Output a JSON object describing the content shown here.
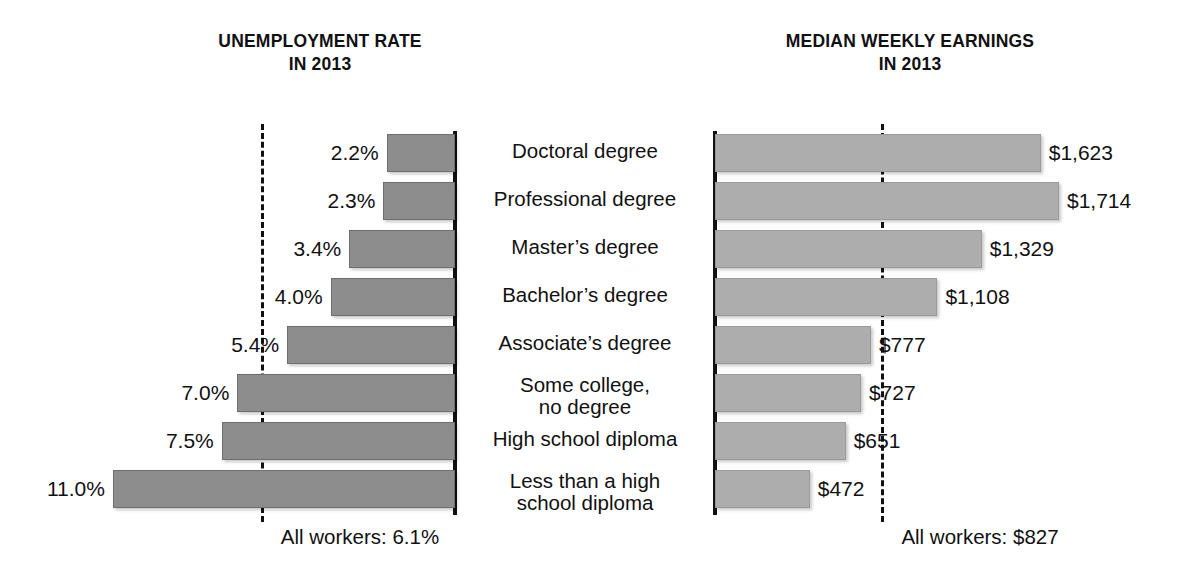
{
  "left_panel": {
    "title_line1": "UNEMPLOYMENT RATE",
    "title_line2": "IN 2013",
    "footer": "All workers: 6.1%"
  },
  "right_panel": {
    "title_line1": "MEDIAN WEEKLY EARNINGS",
    "title_line2": "IN 2013",
    "footer": "All workers: $827"
  },
  "categories": [
    {
      "line1": "Doctoral degree",
      "line2": ""
    },
    {
      "line1": "Professional degree",
      "line2": ""
    },
    {
      "line1": "Master’s degree",
      "line2": ""
    },
    {
      "line1": "Bachelor’s degree",
      "line2": ""
    },
    {
      "line1": "Associate’s degree",
      "line2": ""
    },
    {
      "line1": "Some college,",
      "line2": "no degree"
    },
    {
      "line1": "High school diploma",
      "line2": ""
    },
    {
      "line1": "Less than a high",
      "line2": "school diploma"
    }
  ],
  "unemployment_labels": [
    "2.2%",
    "2.3%",
    "3.4%",
    "4.0%",
    "5.4%",
    "7.0%",
    "7.5%",
    "11.0%"
  ],
  "earnings_labels": [
    "$1,623",
    "$1,714",
    "$1,329",
    "$1,108",
    "$777",
    "$727",
    "$651",
    "$472"
  ],
  "chart_data": [
    {
      "type": "bar",
      "orientation": "horizontal-right-to-left",
      "title": "UNEMPLOYMENT RATE IN 2013",
      "xlabel": "Unemployment rate (percent)",
      "ylabel": "Educational attainment",
      "categories": [
        "Doctoral degree",
        "Professional degree",
        "Master's degree",
        "Bachelor's degree",
        "Associate's degree",
        "Some college, no degree",
        "High school diploma",
        "Less than a high school diploma"
      ],
      "values": [
        2.2,
        2.3,
        3.4,
        4.0,
        5.4,
        7.0,
        7.5,
        11.0
      ],
      "value_labels": [
        "2.2%",
        "2.3%",
        "3.4%",
        "4.0%",
        "5.4%",
        "7.0%",
        "7.5%",
        "11.0%"
      ],
      "xlim": [
        0,
        11.0
      ],
      "grid": false,
      "legend": "none",
      "reference_line": {
        "label": "All workers: 6.1%",
        "value": 6.1,
        "style": "dashed"
      },
      "bar_color": "#8d8d8d"
    },
    {
      "type": "bar",
      "orientation": "horizontal-left-to-right",
      "title": "MEDIAN WEEKLY EARNINGS IN 2013",
      "xlabel": "Median usual weekly earnings (dollars)",
      "ylabel": "Educational attainment",
      "categories": [
        "Doctoral degree",
        "Professional degree",
        "Master's degree",
        "Bachelor's degree",
        "Associate's degree",
        "Some college, no degree",
        "High school diploma",
        "Less than a high school diploma"
      ],
      "values": [
        1623,
        1714,
        1329,
        1108,
        777,
        727,
        651,
        472
      ],
      "value_labels": [
        "$1,623",
        "$1,714",
        "$1,329",
        "$1,108",
        "$777",
        "$727",
        "$651",
        "$472"
      ],
      "xlim": [
        0,
        1714
      ],
      "grid": false,
      "legend": "none",
      "reference_line": {
        "label": "All workers: $827",
        "value": 827,
        "style": "dashed"
      },
      "bar_color": "#adadad"
    }
  ],
  "geometry": {
    "row_top": [
      134,
      182,
      230,
      278,
      326,
      374,
      422,
      470
    ],
    "bar_height": 38,
    "left_axis_x": 455,
    "left_px_per_unit": 31.1,
    "right_axis_x": 715,
    "right_px_per_unit": 0.2007
  }
}
